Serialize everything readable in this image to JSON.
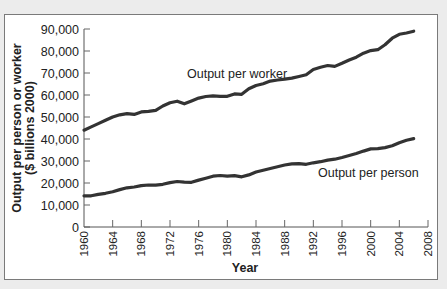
{
  "chart_data": {
    "type": "line",
    "title": "",
    "xlabel": "Year",
    "ylabel": "Output per person or worker",
    "ylabel_line2": "($ billions 2000)",
    "xlim": [
      1960,
      2008
    ],
    "ylim": [
      0,
      90000
    ],
    "grid": false,
    "legend": "inline labels",
    "yticks": [
      0,
      10000,
      20000,
      30000,
      40000,
      50000,
      60000,
      70000,
      80000,
      90000
    ],
    "ytick_labels": [
      "0",
      "10,000",
      "20,000",
      "30,000",
      "40,000",
      "50,000",
      "60,000",
      "70,000",
      "80,000",
      "90,000"
    ],
    "xticks": [
      1960,
      1964,
      1968,
      1972,
      1976,
      1980,
      1984,
      1988,
      1992,
      1996,
      2000,
      2004,
      2008
    ],
    "xtick_labels": [
      "1960",
      "1964",
      "1968",
      "1972",
      "1976",
      "1980",
      "1984",
      "1988",
      "1992",
      "1996",
      "2000",
      "2004",
      "2008"
    ],
    "x": [
      1960,
      1961,
      1962,
      1963,
      1964,
      1965,
      1966,
      1967,
      1968,
      1969,
      1970,
      1971,
      1972,
      1973,
      1974,
      1975,
      1976,
      1977,
      1978,
      1979,
      1980,
      1981,
      1982,
      1983,
      1984,
      1985,
      1986,
      1987,
      1988,
      1989,
      1990,
      1991,
      1992,
      1993,
      1994,
      1995,
      1996,
      1997,
      1998,
      1999,
      2000,
      2001,
      2002,
      2003,
      2004,
      2005,
      2006
    ],
    "series": [
      {
        "name": "Output per worker",
        "label_position": [
          1982,
          68000
        ],
        "values": [
          44000,
          45500,
          47000,
          48500,
          50000,
          51000,
          51500,
          51200,
          52300,
          52600,
          53000,
          55000,
          56500,
          57200,
          56000,
          57300,
          58600,
          59300,
          59600,
          59400,
          59400,
          60500,
          60300,
          62800,
          64300,
          65100,
          66300,
          66800,
          67200,
          67700,
          68400,
          69200,
          71600,
          72600,
          73400,
          73000,
          74400,
          75900,
          77200,
          79000,
          80200,
          80600,
          82800,
          85800,
          87600,
          88200,
          89000
        ]
      },
      {
        "name": "Output per person",
        "label_position": [
          1998,
          25000
        ],
        "values": [
          14200,
          14200,
          14800,
          15300,
          16000,
          17000,
          17800,
          18200,
          18800,
          19100,
          19000,
          19400,
          20200,
          20700,
          20400,
          20300,
          21300,
          22200,
          23100,
          23400,
          23100,
          23300,
          22800,
          23700,
          25000,
          25800,
          26600,
          27400,
          28200,
          28700,
          28800,
          28500,
          29200,
          29700,
          30400,
          30800,
          31600,
          32500,
          33400,
          34500,
          35500,
          35600,
          36100,
          36900,
          38300,
          39400,
          40200
        ]
      }
    ]
  },
  "labels": {
    "worker": "Output per worker",
    "person": "Output per person",
    "xaxis_title": "Year",
    "yaxis_title_1": "Output per person or worker",
    "yaxis_title_2": "($ billions 2000)"
  },
  "colors": {
    "line": "#333333",
    "frame_bg": "#ffffff",
    "page_bg": "#ececec",
    "text": "#222222"
  }
}
